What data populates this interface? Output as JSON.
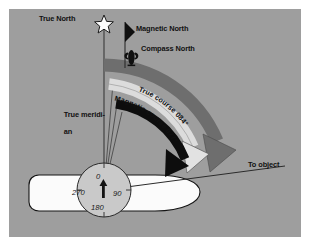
{
  "figure": {
    "title_alt": "Compass, magnetic and true course diagram",
    "panel_color": "#9e9e9e",
    "page_color": "#ffffff"
  },
  "labels": {
    "true_north": "True North",
    "magnetic_north": "Magnetic North",
    "compass_north": "Compass North",
    "true_meridian_line1": "True meridi-",
    "true_meridian_line2": "an",
    "to_object": "To object"
  },
  "arcs": [
    {
      "name": "true-course",
      "label": "True course 084°",
      "color": "#6e6e6e",
      "arrow_color": "#6e6e6e"
    },
    {
      "name": "magnetic-course",
      "label": "Magnetic course 077°",
      "color": "#d8d8d8",
      "arrow_color": "#d8d8d8"
    },
    {
      "name": "compass-course",
      "label": "",
      "color": "#0d0d0d",
      "arrow_color": "#0d0d0d"
    }
  ],
  "compass_rose": {
    "ticks": [
      "0",
      "90",
      "180",
      "270"
    ],
    "needle_color": "#111111",
    "face_color": "#c8c8c8"
  },
  "markers": {
    "true_north_icon": "star",
    "magnetic_north_icon": "pennant-flag",
    "compass_north_icon": "fleur-de-lis"
  },
  "vessel": {
    "name": "ship-hull",
    "fill": "#fbfbfb",
    "stroke": "#111111"
  }
}
